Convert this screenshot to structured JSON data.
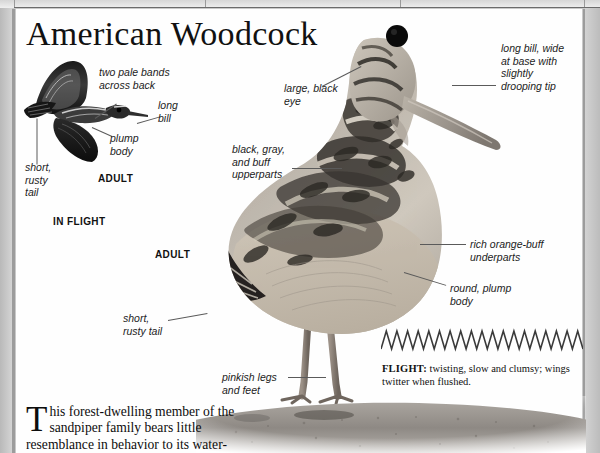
{
  "page": {
    "title": "American Woodcock"
  },
  "flight_illustration": {
    "caption": "IN FLIGHT",
    "age_label": "ADULT",
    "labels": [
      {
        "id": "two-pale-bands",
        "lines": [
          "two pale bands",
          "across back"
        ]
      },
      {
        "id": "long-bill",
        "lines": [
          "long",
          "bill"
        ]
      },
      {
        "id": "plump-body",
        "lines": [
          "plump",
          "body"
        ]
      },
      {
        "id": "short-rusty-tail",
        "lines": [
          "short,",
          "rusty",
          "tail"
        ]
      }
    ]
  },
  "main_illustration": {
    "age_label": "ADULT",
    "labels": [
      {
        "id": "large-black-eye",
        "lines": [
          "large, black",
          "eye"
        ]
      },
      {
        "id": "long-bill-detail",
        "lines": [
          "long bill, wide",
          "at base with",
          "slightly",
          "drooping tip"
        ]
      },
      {
        "id": "upperparts",
        "lines": [
          "black, gray,",
          "and buff",
          "upperparts"
        ]
      },
      {
        "id": "underparts",
        "lines": [
          "rich orange-buff",
          "underparts"
        ]
      },
      {
        "id": "round-plump-body",
        "lines": [
          "round, plump",
          "body"
        ]
      },
      {
        "id": "short-rusty-tail",
        "lines": [
          "short,",
          "rusty tail"
        ]
      },
      {
        "id": "pinkish-legs",
        "lines": [
          "pinkish legs",
          "and feet"
        ]
      }
    ]
  },
  "flight_note": {
    "heading": "FLIGHT:",
    "text": " twisting, slow and clumsy; wings twitter when flushed.",
    "zigzag_peaks": 19
  },
  "body_text": {
    "dropcap": "T",
    "text": "his forest-dwelling member of the sandpiper family bears little resemblance in behavior to its water-"
  },
  "colors": {
    "page_background": "#fefefe",
    "margin_gray": "#c9c9c9",
    "text": "#111111",
    "leader_line": "#5a5a5a"
  }
}
